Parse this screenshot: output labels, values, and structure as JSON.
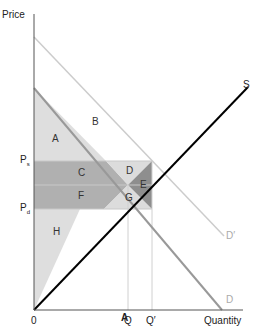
{
  "chart": {
    "axes": {
      "y_label": "Price",
      "x_label": "Quantity",
      "origin": "0"
    },
    "price_labels": {
      "ps": "P",
      "ps_sub": "s",
      "pd": "P",
      "pd_sub": "d"
    },
    "quantity_labels": {
      "q": "Q",
      "q_prime": "Q′"
    },
    "curves": {
      "supply": "S",
      "demand": "D",
      "demand_shifted": "D′"
    },
    "areas": {
      "a": "A",
      "b": "B",
      "c": "C",
      "d": "D",
      "e": "E",
      "f": "F",
      "g": "G",
      "h": "H"
    },
    "caption": "A",
    "colors": {
      "supply": "#000000",
      "demand": "#999999",
      "demand_shifted": "#cccccc",
      "dark_fill": "#a6a6a6",
      "mid_fill": "#b8b8b8",
      "light_fill": "#dcdcdc",
      "darker_fill": "#8c8c8c"
    }
  }
}
